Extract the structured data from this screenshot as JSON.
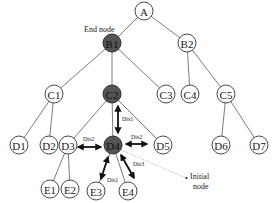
{
  "diagram": {
    "nodes": [
      {
        "id": "A",
        "label": "A",
        "highlighted": false
      },
      {
        "id": "B1",
        "label": "B1",
        "highlighted": true
      },
      {
        "id": "B2",
        "label": "B2",
        "highlighted": false
      },
      {
        "id": "C1",
        "label": "C1",
        "highlighted": false
      },
      {
        "id": "C2",
        "label": "C2",
        "highlighted": true
      },
      {
        "id": "C3",
        "label": "C3",
        "highlighted": false
      },
      {
        "id": "C4",
        "label": "C4",
        "highlighted": false
      },
      {
        "id": "C5",
        "label": "C5",
        "highlighted": false
      },
      {
        "id": "D1",
        "label": "D1",
        "highlighted": false
      },
      {
        "id": "D2",
        "label": "D2",
        "highlighted": false
      },
      {
        "id": "D3",
        "label": "D3",
        "highlighted": false
      },
      {
        "id": "D4",
        "label": "D4",
        "highlighted": true
      },
      {
        "id": "D5",
        "label": "D5",
        "highlighted": false
      },
      {
        "id": "D6",
        "label": "D6",
        "highlighted": false
      },
      {
        "id": "D7",
        "label": "D7",
        "highlighted": false
      },
      {
        "id": "E1",
        "label": "E1",
        "highlighted": false
      },
      {
        "id": "E2",
        "label": "E2",
        "highlighted": false
      },
      {
        "id": "E3",
        "label": "E3",
        "highlighted": false
      },
      {
        "id": "E4",
        "label": "E4",
        "highlighted": false
      }
    ],
    "edges": [
      [
        "A",
        "B1"
      ],
      [
        "A",
        "B2"
      ],
      [
        "B1",
        "C1"
      ],
      [
        "B1",
        "C2"
      ],
      [
        "B1",
        "C3"
      ],
      [
        "B2",
        "C4"
      ],
      [
        "B2",
        "C5"
      ],
      [
        "C1",
        "D1"
      ],
      [
        "C1",
        "D2"
      ],
      [
        "C2",
        "D3"
      ],
      [
        "C2",
        "D4"
      ],
      [
        "C2",
        "D5"
      ],
      [
        "C5",
        "D6"
      ],
      [
        "C5",
        "D7"
      ],
      [
        "D3",
        "E1"
      ],
      [
        "D3",
        "E2"
      ],
      [
        "D4",
        "E3"
      ],
      [
        "D4",
        "E4"
      ]
    ],
    "distance_arrows": [
      {
        "from": "C2",
        "to": "D4",
        "label": "Dis1"
      },
      {
        "from": "D3",
        "to": "D4",
        "label": "Dis2"
      },
      {
        "from": "D4",
        "to": "D5",
        "label": "Dis2"
      },
      {
        "from": "D4",
        "to": "E3",
        "label": "Dis1"
      },
      {
        "from": "D4",
        "to": "E4",
        "label": "Dis3"
      }
    ],
    "annotations": {
      "end_node": "End node",
      "initial_node_line1": "Initial",
      "initial_node_line2": "node"
    },
    "colors": {
      "highlight_fill": "#555555",
      "node_stroke": "#333333",
      "edge": "#444444",
      "arrow": "#111111"
    }
  }
}
